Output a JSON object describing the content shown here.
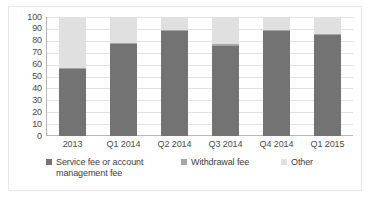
{
  "chart_data": {
    "type": "bar",
    "subtype": "stacked-column",
    "title": "",
    "subtitle": "",
    "xlabel": "",
    "ylabel": "",
    "categories": [
      "2013",
      "Q1 2014",
      "Q2 2014",
      "Q3 2014",
      "Q4 2014",
      "Q1 2015"
    ],
    "series": [
      {
        "name": "Service fee or account management fee",
        "color": "#737373",
        "values": [
          56,
          77,
          88,
          76,
          88,
          85
        ]
      },
      {
        "name": "Withdrawal fee",
        "color": "#a6a6a6",
        "values": [
          1,
          1,
          1,
          1,
          1,
          1
        ]
      },
      {
        "name": "Other",
        "color": "#e0e0e0",
        "values": [
          43,
          22,
          11,
          23,
          11,
          14
        ]
      }
    ],
    "ylim": [
      0,
      100
    ],
    "yticks": [
      0,
      10,
      20,
      30,
      40,
      50,
      60,
      70,
      80,
      90,
      100
    ],
    "ytick_labels": [
      "0",
      "10",
      "20",
      "30",
      "40",
      "50",
      "60",
      "70",
      "80",
      "90",
      "100"
    ],
    "grid": true,
    "grid_axis": "y",
    "legend_position": "bottom",
    "stack_total": 100
  },
  "legend": {
    "entries": [
      {
        "label": "Service fee or account management fee",
        "color": "#737373"
      },
      {
        "label": "Withdrawal fee",
        "color": "#a6a6a6"
      },
      {
        "label": "Other",
        "color": "#e0e0e0"
      }
    ]
  },
  "colors": {
    "service_fee": "#737373",
    "withdrawal_fee": "#a6a6a6",
    "other": "#e0e0e0",
    "gridline": "#e2e2e2",
    "axis": "#b8b8b8",
    "text": "#4a4a4a",
    "frame": "#e8e8e8",
    "background": "#ffffff"
  }
}
